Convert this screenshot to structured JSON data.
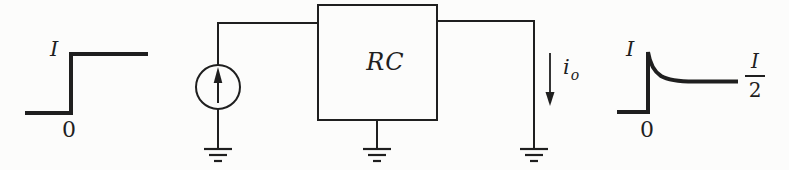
{
  "figure": {
    "input_waveform": {
      "type": "step",
      "amplitude_label": "I",
      "origin_label": "0"
    },
    "circuit": {
      "source_type": "current-source",
      "block_label": "RC",
      "output_current_main": "i",
      "output_current_sub": "o",
      "ground_count": 3
    },
    "output_waveform": {
      "type": "exponential-decay",
      "peak_label": "I",
      "origin_label": "0",
      "final_value_numerator": "I",
      "final_value_denominator": "2"
    }
  },
  "colors": {
    "ink": "#1f1f1f",
    "paper": "#fcfcfb"
  }
}
